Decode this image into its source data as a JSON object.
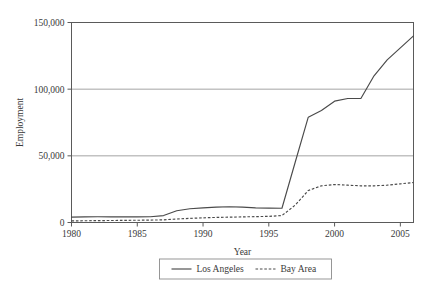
{
  "chart_data": {
    "type": "line",
    "title": "",
    "xlabel": "Year",
    "ylabel": "Employment",
    "xlim": [
      1980,
      2006
    ],
    "ylim": [
      0,
      150000
    ],
    "grid": true,
    "legend_position": "bottom-center",
    "x_ticks": [
      "1980",
      "1985",
      "1990",
      "1995",
      "2000",
      "2005"
    ],
    "x_tick_values": [
      1980,
      1985,
      1990,
      1995,
      2000,
      2005
    ],
    "y_ticks": [
      "0",
      "50,000",
      "100,000",
      "150,000"
    ],
    "y_tick_values": [
      0,
      50000,
      100000,
      150000
    ],
    "x": [
      1980,
      1981,
      1982,
      1983,
      1984,
      1985,
      1986,
      1987,
      1988,
      1989,
      1990,
      1991,
      1992,
      1993,
      1994,
      1995,
      1996,
      1997,
      1998,
      1999,
      2000,
      2001,
      2002,
      2003,
      2004,
      2005,
      2006
    ],
    "series": [
      {
        "name": "Los Angeles",
        "style": "solid",
        "color": "#4a4a4a",
        "values": [
          4000,
          4200,
          4300,
          4200,
          4200,
          4200,
          4300,
          5200,
          8800,
          10300,
          11000,
          11500,
          11800,
          11500,
          11000,
          10800,
          10700,
          45000,
          79000,
          84000,
          91000,
          93000,
          93000,
          110000,
          122000,
          131000,
          140000
        ]
      },
      {
        "name": "Bay Area",
        "style": "dashed",
        "color": "#4a4a4a",
        "values": [
          1200,
          1300,
          1400,
          1500,
          1600,
          1700,
          1800,
          2000,
          2600,
          3100,
          3500,
          3800,
          4000,
          4200,
          4400,
          4600,
          5200,
          13000,
          24000,
          27500,
          28500,
          28000,
          27500,
          27500,
          28000,
          29000,
          30000
        ]
      }
    ]
  },
  "legend": {
    "items": [
      {
        "label": "Los Angeles",
        "style": "solid"
      },
      {
        "label": "Bay Area",
        "style": "dashed"
      }
    ]
  }
}
